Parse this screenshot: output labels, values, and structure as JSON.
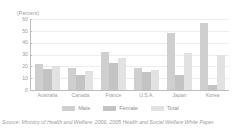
{
  "chart_data": {
    "type": "bar",
    "title": "",
    "subtitle": "",
    "xlabel": "",
    "ylabel": "(Percent)",
    "unit_label": "(Percent)",
    "ylim": [
      0,
      60
    ],
    "yticks": [
      60,
      50,
      40,
      30,
      20,
      10,
      0
    ],
    "ytick_labels": [
      "60",
      "50",
      "40",
      "30",
      "20",
      "10",
      "0"
    ],
    "grid": "horizontal",
    "legend_position": "bottom-center",
    "categories": [
      "Australia",
      "Canada",
      "France",
      "U.S.A.",
      "Japan",
      "Korea"
    ],
    "series": [
      {
        "name": "Male",
        "color": "#cfcfcf",
        "values": [
          22,
          19,
          32,
          19,
          48,
          57
        ]
      },
      {
        "name": "Female",
        "color": "#c3c3c3",
        "values": [
          18,
          13,
          23,
          15,
          13,
          4
        ]
      },
      {
        "name": "Total",
        "color": "#e2e2e2",
        "values": [
          20,
          16,
          27,
          17,
          31,
          30
        ]
      }
    ],
    "annotations": [],
    "source": "Source: Ministry of Health and Welfare, 2006, 2005 Health and Social Welfare White Paper."
  },
  "legend": {
    "items": [
      {
        "label": "Male"
      },
      {
        "label": "Female"
      },
      {
        "label": "Total"
      }
    ]
  },
  "caption": {
    "source_text": "Source: Ministry of Health and Welfare, 2006, 2005 Health and Social Welfare White Paper."
  }
}
